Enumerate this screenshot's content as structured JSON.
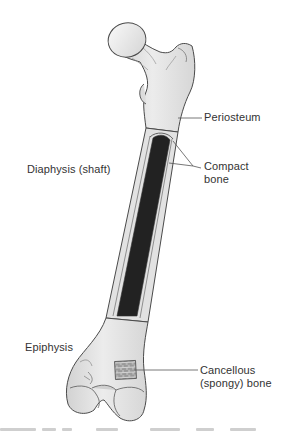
{
  "figure": {
    "colors": {
      "bone_fill": "#e4e4e4",
      "bone_light": "#f2f2f2",
      "bone_shadow": "#c9c9c9",
      "outline": "#4a4a4a",
      "medullary_cavity": "#222222",
      "compact_bone": "#dcdcdc",
      "cancellous_patch": "#8c8c8c",
      "leader_line": "#555555",
      "label_text": "#333333"
    }
  },
  "labels": {
    "periosteum": "Periosteum",
    "diaphysis": "Diaphysis (shaft)",
    "compact_bone": {
      "line1": "Compact",
      "line2": "bone"
    },
    "epiphysis": "Epiphysis",
    "cancellous_bone": {
      "line1": "Cancellous",
      "line2": "(spongy) bone"
    }
  }
}
